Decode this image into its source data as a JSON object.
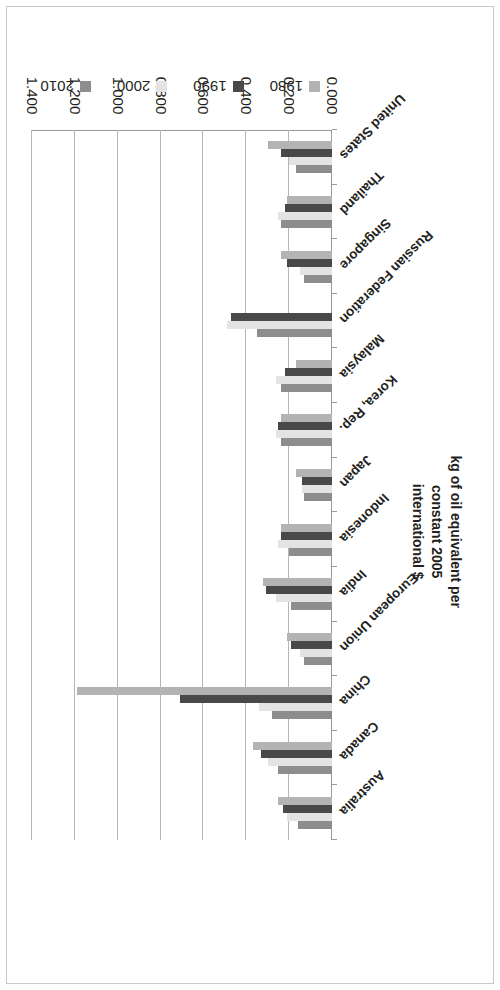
{
  "chart_data": {
    "type": "bar",
    "orientation": "horizontal",
    "title": "",
    "xlabel": "",
    "ylabel": "kg of oil equivalent per constant 2005 international $",
    "axis_title_lines": [
      "kg of oil equivalent per constant 2005",
      "international $"
    ],
    "value_axis_range": [
      0.0,
      1.4
    ],
    "value_axis_step": 0.2,
    "value_axis_ticks": [
      "0.000",
      "0.200",
      "0.400",
      "0.600",
      "0.800",
      "1.000",
      "1.200",
      "1.400"
    ],
    "value_axis_tick_values": [
      0.0,
      0.2,
      0.4,
      0.6,
      0.8,
      1.0,
      1.2,
      1.4
    ],
    "grid": true,
    "legend_position": "bottom",
    "categories": [
      "Australia",
      "Canada",
      "China",
      "European Union",
      "India",
      "Indonesia",
      "Japan",
      "Korea, Rep.",
      "Malaysia",
      "Russian Federation",
      "Singapore",
      "Thailand",
      "United States"
    ],
    "series": [
      {
        "name": "1980",
        "color": "#b3b3b3",
        "values": [
          0.25,
          0.37,
          1.19,
          0.21,
          0.32,
          0.24,
          0.17,
          0.24,
          0.17,
          null,
          0.24,
          0.21,
          0.3
        ]
      },
      {
        "name": "1990",
        "color": "#494949",
        "values": [
          0.23,
          0.33,
          0.71,
          0.19,
          0.31,
          0.24,
          0.14,
          0.25,
          0.22,
          0.47,
          0.21,
          0.22,
          0.24
        ]
      },
      {
        "name": "2000",
        "color": "#e3e3e3",
        "values": [
          0.21,
          0.3,
          0.34,
          0.15,
          0.26,
          0.25,
          0.14,
          0.26,
          0.26,
          0.49,
          0.15,
          0.25,
          0.2
        ]
      },
      {
        "name": "2010",
        "color": "#8d8d8d",
        "values": [
          0.16,
          0.25,
          0.28,
          0.13,
          0.19,
          0.2,
          0.13,
          0.24,
          0.24,
          0.35,
          0.13,
          0.24,
          0.17
        ]
      }
    ]
  },
  "legend": {
    "items": [
      {
        "label": "1980",
        "color": "#b3b3b3"
      },
      {
        "label": "1990",
        "color": "#494949"
      },
      {
        "label": "2000",
        "color": "#e3e3e3"
      },
      {
        "label": "2010",
        "color": "#8d8d8d"
      }
    ]
  }
}
